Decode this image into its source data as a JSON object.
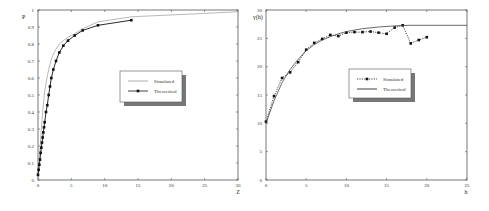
{
  "chart_data": [
    {
      "type": "line",
      "title": "",
      "xlabel": "Z",
      "ylabel": "P",
      "xlim": [
        0,
        30
      ],
      "ylim": [
        0,
        1
      ],
      "xticks": [
        "0",
        "5",
        "10",
        "15",
        "20",
        "25",
        "30"
      ],
      "yticks": [
        "0",
        "0.1",
        "0.2",
        "0.3",
        "0.4",
        "0.5",
        "0.6",
        "0.7",
        "0.8",
        "0.9",
        "1"
      ],
      "grid": false,
      "legend_position": "center-right",
      "legend": [
        "Simulated",
        "Theoretical"
      ],
      "series": [
        {
          "name": "Simulated",
          "style": "thin gray line",
          "x": [
            0,
            0.1,
            0.2,
            0.3,
            0.4,
            0.5,
            0.6,
            0.7,
            0.8,
            0.9,
            1.0,
            1.2,
            1.4,
            1.6,
            1.8,
            2.0,
            2.3,
            2.7,
            3.2,
            3.8,
            4.5,
            5.5,
            6.7,
            9,
            14,
            25,
            30
          ],
          "y": [
            0,
            0.06,
            0.12,
            0.18,
            0.24,
            0.3,
            0.35,
            0.4,
            0.44,
            0.48,
            0.52,
            0.57,
            0.61,
            0.65,
            0.68,
            0.71,
            0.74,
            0.77,
            0.8,
            0.82,
            0.84,
            0.86,
            0.89,
            0.93,
            0.96,
            0.98,
            0.99
          ]
        },
        {
          "name": "Theoretical",
          "style": "black line with square markers",
          "x": [
            0,
            0.1,
            0.2,
            0.3,
            0.4,
            0.5,
            0.6,
            0.7,
            0.8,
            0.9,
            1.0,
            1.2,
            1.4,
            1.6,
            1.8,
            2.0,
            2.3,
            2.7,
            3.2,
            3.8,
            4.5,
            5.5,
            6.7,
            9,
            14
          ],
          "y": [
            0.03,
            0.06,
            0.09,
            0.12,
            0.16,
            0.19,
            0.22,
            0.25,
            0.28,
            0.31,
            0.34,
            0.4,
            0.44,
            0.5,
            0.55,
            0.6,
            0.65,
            0.7,
            0.75,
            0.79,
            0.82,
            0.85,
            0.88,
            0.91,
            0.94
          ]
        }
      ]
    },
    {
      "type": "line",
      "title": "",
      "xlabel": "h",
      "ylabel": "γ(h)",
      "xlim": [
        0,
        25
      ],
      "ylim": [
        0,
        30
      ],
      "xticks": [
        "0",
        "5",
        "10",
        "15",
        "20",
        "25"
      ],
      "yticks": [
        "0",
        "5",
        "10",
        "15",
        "20",
        "25",
        "30"
      ],
      "grid": false,
      "legend_position": "center-right",
      "legend": [
        "Simulated",
        "Theoretical"
      ],
      "series": [
        {
          "name": "Simulated",
          "style": "dotted line with markers",
          "x": [
            0,
            1,
            2,
            3,
            4,
            5,
            6,
            7,
            8,
            9,
            10,
            11,
            12,
            13,
            14,
            15,
            16,
            17,
            18,
            19,
            20
          ],
          "y": [
            10.3,
            14.8,
            18,
            19,
            20.8,
            23,
            24.2,
            24.9,
            25.6,
            25.4,
            26,
            26.1,
            26.1,
            26.2,
            26,
            25.8,
            26.9,
            27.3,
            24.1,
            24.7,
            25.2
          ]
        },
        {
          "name": "Theoretical",
          "style": "solid line",
          "x": [
            0,
            1,
            2,
            3,
            4,
            5,
            6,
            7,
            8,
            9,
            10,
            12,
            14,
            16,
            18,
            20,
            22,
            25
          ],
          "y": [
            10,
            14,
            17.2,
            19.5,
            21.3,
            22.8,
            23.9,
            24.7,
            25.3,
            25.8,
            26.2,
            26.7,
            27,
            27.2,
            27.3,
            27.3,
            27.3,
            27.3
          ]
        }
      ]
    }
  ]
}
